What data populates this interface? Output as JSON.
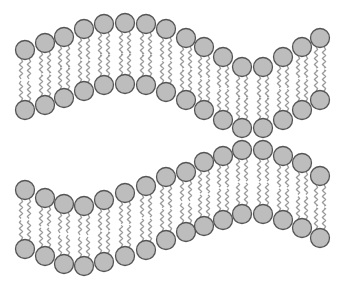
{
  "diagram": {
    "title": "",
    "colors": {
      "background": "#ffffff",
      "head_fill": "#bdbdbd",
      "head_stroke": "#555555",
      "tail_stroke": "#9a9a9a"
    },
    "head_radius": 9.5,
    "tail_offset": 4,
    "bilayers": [
      {
        "name": "upper-bilayer",
        "upper_leaflet": [
          [
            25,
            50
          ],
          [
            45,
            43
          ],
          [
            64,
            37
          ],
          [
            84,
            29
          ],
          [
            104,
            24
          ],
          [
            125,
            23
          ],
          [
            146,
            24
          ],
          [
            166,
            29
          ],
          [
            186,
            38
          ],
          [
            204,
            47
          ],
          [
            223,
            57
          ],
          [
            242,
            67
          ],
          [
            263,
            67
          ],
          [
            283,
            57
          ],
          [
            302,
            47
          ],
          [
            320,
            38
          ]
        ],
        "lower_leaflet": [
          [
            25,
            110
          ],
          [
            45,
            105
          ],
          [
            64,
            98
          ],
          [
            84,
            91
          ],
          [
            104,
            85
          ],
          [
            125,
            84
          ],
          [
            146,
            85
          ],
          [
            166,
            92
          ],
          [
            186,
            100
          ],
          [
            204,
            110
          ],
          [
            223,
            120
          ],
          [
            242,
            128
          ],
          [
            263,
            128
          ],
          [
            283,
            120
          ],
          [
            302,
            110
          ],
          [
            320,
            100
          ]
        ]
      },
      {
        "name": "lower-bilayer",
        "upper_leaflet": [
          [
            25,
            190
          ],
          [
            45,
            198
          ],
          [
            64,
            204
          ],
          [
            84,
            206
          ],
          [
            104,
            200
          ],
          [
            125,
            193
          ],
          [
            146,
            186
          ],
          [
            166,
            177
          ],
          [
            186,
            172
          ],
          [
            204,
            162
          ],
          [
            223,
            156
          ],
          [
            242,
            150
          ],
          [
            263,
            150
          ],
          [
            283,
            156
          ],
          [
            302,
            163
          ],
          [
            320,
            176
          ]
        ],
        "lower_leaflet": [
          [
            25,
            249
          ],
          [
            45,
            256
          ],
          [
            64,
            264
          ],
          [
            84,
            266
          ],
          [
            104,
            262
          ],
          [
            125,
            256
          ],
          [
            146,
            250
          ],
          [
            166,
            240
          ],
          [
            186,
            232
          ],
          [
            204,
            226
          ],
          [
            223,
            220
          ],
          [
            242,
            214
          ],
          [
            263,
            214
          ],
          [
            283,
            220
          ],
          [
            302,
            228
          ],
          [
            320,
            238
          ]
        ]
      }
    ]
  }
}
